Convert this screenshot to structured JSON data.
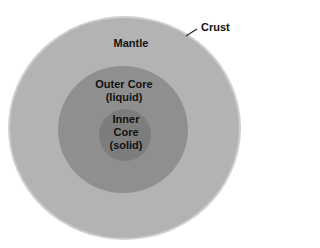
{
  "diagram": {
    "type": "concentric-layers",
    "layers": [
      {
        "id": "crust",
        "label": "Crust",
        "color": "#cfcfcf"
      },
      {
        "id": "mantle",
        "label": "Mantle",
        "color": "#b3b3b3"
      },
      {
        "id": "outer_core",
        "label": "Outer Core",
        "state": "(liquid)",
        "color": "#8f8f8f"
      },
      {
        "id": "inner_core",
        "label_line1": "Inner",
        "label_line2": "Core",
        "state": "(solid)",
        "color": "#7d7d7d"
      }
    ],
    "text_color": "#111111",
    "leader_color": "#222222"
  }
}
